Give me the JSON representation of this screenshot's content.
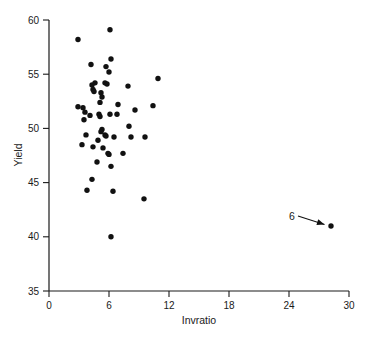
{
  "chart_data": {
    "type": "scatter",
    "title": "",
    "xlabel": "Invratio",
    "ylabel": "Yield",
    "xlim": [
      0,
      30
    ],
    "ylim": [
      35,
      60
    ],
    "xticks": [
      0,
      6,
      12,
      18,
      24,
      30
    ],
    "yticks": [
      35,
      40,
      45,
      50,
      55,
      60
    ],
    "xtick_labels": [
      "0",
      "6",
      "12",
      "18",
      "24",
      "30"
    ],
    "ytick_labels": [
      "35",
      "40",
      "45",
      "50",
      "55",
      "60"
    ],
    "grid": false,
    "legend": "none",
    "marker": "filled-circle",
    "marker_color": "#111111",
    "points": [
      {
        "x": 2.9,
        "y": 58.2
      },
      {
        "x": 6.1,
        "y": 59.1
      },
      {
        "x": 6.2,
        "y": 56.4
      },
      {
        "x": 4.2,
        "y": 55.9
      },
      {
        "x": 5.7,
        "y": 55.7
      },
      {
        "x": 6.0,
        "y": 55.2
      },
      {
        "x": 10.9,
        "y": 54.6
      },
      {
        "x": 4.6,
        "y": 54.2
      },
      {
        "x": 4.3,
        "y": 54.0
      },
      {
        "x": 5.6,
        "y": 54.2
      },
      {
        "x": 5.8,
        "y": 54.1
      },
      {
        "x": 7.9,
        "y": 53.9
      },
      {
        "x": 4.4,
        "y": 53.6
      },
      {
        "x": 4.5,
        "y": 53.4
      },
      {
        "x": 5.2,
        "y": 53.3
      },
      {
        "x": 5.3,
        "y": 52.9
      },
      {
        "x": 5.1,
        "y": 52.4
      },
      {
        "x": 6.9,
        "y": 52.2
      },
      {
        "x": 10.4,
        "y": 52.1
      },
      {
        "x": 2.9,
        "y": 52.0
      },
      {
        "x": 3.4,
        "y": 51.9
      },
      {
        "x": 8.6,
        "y": 51.7
      },
      {
        "x": 3.6,
        "y": 51.5
      },
      {
        "x": 4.1,
        "y": 51.2
      },
      {
        "x": 5.0,
        "y": 51.3
      },
      {
        "x": 5.1,
        "y": 51.1
      },
      {
        "x": 6.1,
        "y": 51.3
      },
      {
        "x": 6.8,
        "y": 51.3
      },
      {
        "x": 3.5,
        "y": 50.8
      },
      {
        "x": 8.0,
        "y": 50.2
      },
      {
        "x": 5.3,
        "y": 49.9
      },
      {
        "x": 5.2,
        "y": 49.7
      },
      {
        "x": 3.7,
        "y": 49.4
      },
      {
        "x": 5.6,
        "y": 49.4
      },
      {
        "x": 5.7,
        "y": 49.3
      },
      {
        "x": 6.5,
        "y": 49.2
      },
      {
        "x": 8.2,
        "y": 49.2
      },
      {
        "x": 9.6,
        "y": 49.2
      },
      {
        "x": 4.9,
        "y": 48.9
      },
      {
        "x": 3.3,
        "y": 48.5
      },
      {
        "x": 4.4,
        "y": 48.3
      },
      {
        "x": 5.4,
        "y": 48.2
      },
      {
        "x": 5.9,
        "y": 47.7
      },
      {
        "x": 6.0,
        "y": 47.6
      },
      {
        "x": 7.4,
        "y": 47.7
      },
      {
        "x": 4.8,
        "y": 46.9
      },
      {
        "x": 6.2,
        "y": 46.5
      },
      {
        "x": 4.3,
        "y": 45.3
      },
      {
        "x": 3.8,
        "y": 44.3
      },
      {
        "x": 6.4,
        "y": 44.2
      },
      {
        "x": 9.5,
        "y": 43.5
      },
      {
        "x": 28.2,
        "y": 41.0
      },
      {
        "x": 6.2,
        "y": 40.0
      }
    ],
    "annotations": [
      {
        "label": "6",
        "target_x": 28.2,
        "target_y": 41.0,
        "type": "arrow-pointer"
      }
    ]
  }
}
